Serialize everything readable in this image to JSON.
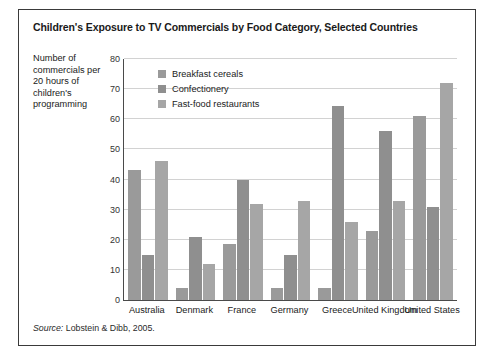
{
  "figure": {
    "title": "Children's Exposure to TV Commercials by Food Category, Selected Countries",
    "axis_title": "Number of commercials per 20 hours of children's programming",
    "source_prefix": "Source:",
    "source_text": "Lobstein & Dibb, 2005."
  },
  "colors": {
    "series_1": "#9a9a9a",
    "series_2": "#8f8f8f",
    "series_3": "#a6a6a6",
    "gridline": "#d2d2d2",
    "axis": "#4a4a4a",
    "border": "#3a3a3a",
    "text": "#1a1a1a"
  },
  "chart_data": {
    "type": "bar",
    "title": "Children's Exposure to TV Commercials by Food Category, Selected Countries",
    "xlabel": "",
    "ylabel": "Number of commercials per 20 hours of children's programming",
    "ylim": [
      0,
      80
    ],
    "yticks": [
      0,
      10,
      20,
      30,
      40,
      50,
      60,
      70,
      80
    ],
    "grid": true,
    "legend_position": "top-left",
    "categories": [
      "Australia",
      "Denmark",
      "France",
      "Germany",
      "Greece",
      "United Kingdom",
      "United States"
    ],
    "series": [
      {
        "name": "Breakfast cereals",
        "values": [
          43,
          4,
          18.5,
          4,
          4,
          23,
          61
        ]
      },
      {
        "name": "Confectionery",
        "values": [
          15,
          21,
          40,
          15,
          64.5,
          56,
          31
        ]
      },
      {
        "name": "Fast-food restaurants",
        "values": [
          46,
          12,
          32,
          33,
          26,
          33,
          72
        ]
      }
    ]
  }
}
